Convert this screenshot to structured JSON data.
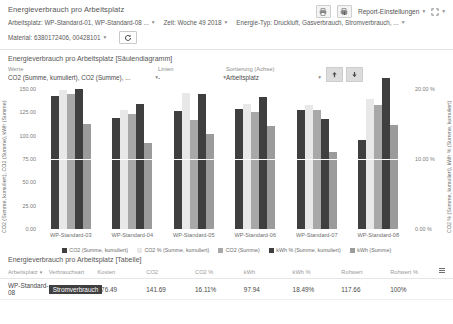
{
  "header": {
    "title": "Energieverbrauch pro Arbeitsplatz",
    "filters": [
      {
        "label": "Arbeitsplatz: WP-Standard-01, WP-Standard-08 ..."
      },
      {
        "label": "Zeit: Woche 49 2018"
      },
      {
        "label": "Energie-Typ: Druckluft, Gasverbrauch, Stromverbrauch, ..."
      }
    ],
    "filters_row2": [
      {
        "label": "Material: 6380172406, 00428101"
      }
    ],
    "refresh_icon": "refresh-icon",
    "print_icon": "print-icon",
    "export_icon": "export-report-icon",
    "settings_label": "Report-Einstellungen",
    "fullscreen_icon": "fullscreen-icon"
  },
  "chart_panel": {
    "title": "Energieverbrauch pro Arbeitsplatz [Säulendiagramm]",
    "controls": {
      "werte_label": "Werte",
      "werte_value": "CO2 (Summe, kumuliert), CO2 (Summe), ...",
      "linien_label": "Linien",
      "linien_value": "-",
      "sortierung_label": "Sortierung (Achse)",
      "sortierung_value": "Arbeitsplatz",
      "sort_asc_icon": "arrow-up-icon",
      "sort_desc_icon": "arrow-down-icon"
    }
  },
  "chart_data": {
    "type": "bar",
    "title": "Energieverbrauch pro Arbeitsplatz [Säulendiagramm]",
    "xlabel": "",
    "ylabel": "CO2 (Summe, kumuliert), CO2 (Summe), kWh (Summe)",
    "y2label": "CO2 % (Summe, kumuliert), kWh % (Summe, kumuliert)",
    "ylim": [
      0,
      150
    ],
    "y2lim": [
      0,
      20
    ],
    "yticks": [
      "0.00",
      "25.00",
      "50.00",
      "75.00",
      "100.00",
      "125.00",
      "150.00"
    ],
    "y2ticks": [
      "0.00 %",
      "10.00 %",
      "20.00 %"
    ],
    "grid": true,
    "legend_position": "bottom",
    "categories": [
      "WP-Standard-03",
      "WP-Standard-04",
      "WP-Standard-05",
      "WP-Standard-06",
      "WP-Standard-07",
      "WP-Standard-08"
    ],
    "series": [
      {
        "name": "CO2 (Summe, kumuliert)",
        "color": "#3f3f3f",
        "axis": "left",
        "values": [
          143.0,
          119.0,
          126.0,
          129.0,
          127.0,
          95.0
        ]
      },
      {
        "name": "CO2 % (Summe, kumuliert)",
        "color": "#e8e8e8",
        "axis": "right",
        "values": [
          19.9,
          17.0,
          19.4,
          17.9,
          17.7,
          18.6
        ]
      },
      {
        "name": "CO2 (Summe)",
        "color": "#a8a8a8",
        "axis": "left",
        "values": [
          145.0,
          123.0,
          117.0,
          125.0,
          127.0,
          133.0
        ]
      },
      {
        "name": "kWh % (Summe, kumuliert)",
        "color": "#3f3f3f",
        "axis": "right",
        "values": [
          20.0,
          17.9,
          19.3,
          18.9,
          15.7,
          21.6
        ]
      },
      {
        "name": "kWh (Summe)",
        "color": "#9b9b9b",
        "axis": "left",
        "values": [
          113.0,
          92.0,
          102.0,
          110.0,
          83.0,
          111.0
        ]
      }
    ]
  },
  "table_panel": {
    "title": "Energieverbrauch pro Arbeitsplatz [Tabelle]",
    "grip_icon": "column-settings-icon",
    "sort_icon": "sort-arrow-icon",
    "columns": [
      "Arbeitsplatz",
      "Verbrauchsart",
      "Kosten",
      "CO2",
      "CO2 %",
      "kWh",
      "kWh %",
      "Rohwert",
      "Rohwert %"
    ],
    "rows": [
      {
        "arbeitsplatz": "WP-Standard-08",
        "verbrauchsart": "Stromverbrauch",
        "kosten": "176.49",
        "co2": "141.69",
        "co2_pct": "16.11%",
        "kwh": "97.94",
        "kwh_pct": "18.49%",
        "rohwert": "117.66",
        "rohwert_pct": "100%"
      }
    ]
  }
}
